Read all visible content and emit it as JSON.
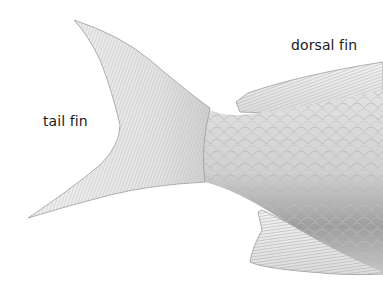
{
  "diagram": {
    "labels": [
      {
        "id": "tail_fin",
        "text": "tail fin"
      },
      {
        "id": "dorsal_fin",
        "text": "dorsal fin"
      }
    ],
    "colors": {
      "background": "#ffffff",
      "fin_light": "#ececec",
      "fin_ray": "#a8a8a8",
      "body_light": "#d9d9d9",
      "body_dark": "#9a9a9a",
      "outline": "#8a8a8a",
      "label_text": "#1a1a1a"
    }
  }
}
